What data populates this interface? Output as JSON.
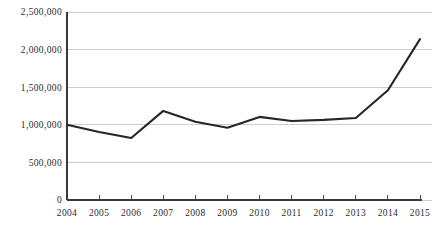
{
  "chart_data": {
    "type": "line",
    "title": "",
    "subtitle": "",
    "xlabel": "",
    "ylabel": "",
    "categories": [
      "2004",
      "2005",
      "2006",
      "2007",
      "2008",
      "2009",
      "2010",
      "2011",
      "2012",
      "2013",
      "2014",
      "2015"
    ],
    "x": [
      2004,
      2005,
      2006,
      2007,
      2008,
      2009,
      2010,
      2011,
      2012,
      2013,
      2014,
      2015
    ],
    "values": [
      1000000,
      905000,
      825000,
      1185000,
      1040000,
      960000,
      1105000,
      1050000,
      1065000,
      1090000,
      1460000,
      2140000
    ],
    "series": [
      {
        "name": "",
        "values": [
          1000000,
          905000,
          825000,
          1185000,
          1040000,
          960000,
          1105000,
          1050000,
          1065000,
          1090000,
          1460000,
          2140000
        ]
      }
    ],
    "ylim": [
      0,
      2500000
    ],
    "xlim": [
      2004,
      2015
    ],
    "ytick_values": [
      0,
      500000,
      1000000,
      1500000,
      2000000,
      2500000
    ],
    "ytick_labels": [
      "0",
      "500,000",
      "1,000,000",
      "1,500,000",
      "2,000,000",
      "2,500,000"
    ],
    "xtick_labels": [
      "2004",
      "2005",
      "2006",
      "2007",
      "2008",
      "2009",
      "2010",
      "2011",
      "2012",
      "2013",
      "2014",
      "2015"
    ],
    "grid": true,
    "grid_axis": "y",
    "legend": false,
    "legend_position": "none",
    "annotations": [],
    "colors": {
      "line": "#262626",
      "grid": "#b9b9b9",
      "axis": "#3a3a3a",
      "text": "#2b2b2b",
      "background": "#ffffff"
    }
  },
  "axes": {
    "y_axis_name": "y-axis",
    "x_axis_name": "x-axis"
  }
}
